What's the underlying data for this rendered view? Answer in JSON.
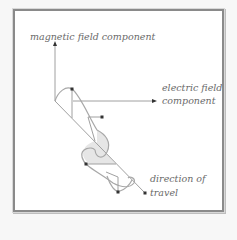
{
  "diagram": {
    "labels": {
      "magnetic": "magnetic field component",
      "electric_line1": "electric field",
      "electric_line2": "component",
      "travel_line1": "direction of",
      "travel_line2": "travel"
    },
    "colors": {
      "frame_border": "#8a8a8a",
      "line": "#9a9a9a",
      "wave_fill": "#e6e6e6",
      "arrowhead": "#333333",
      "label_text": "#6a6a6a"
    }
  }
}
